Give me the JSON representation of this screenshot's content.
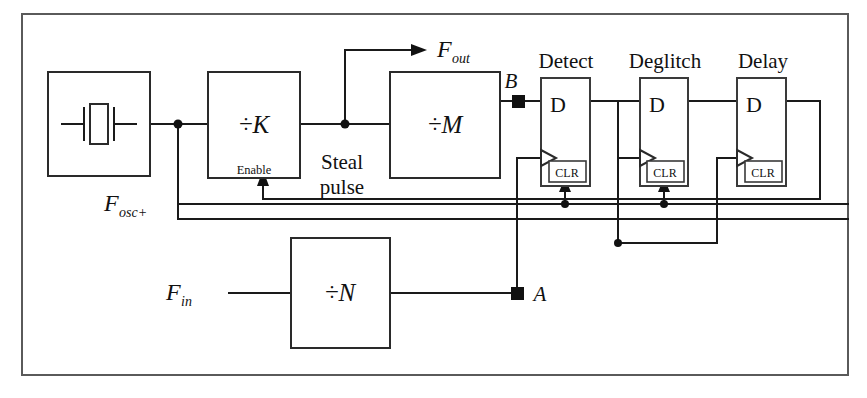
{
  "figure": {
    "type": "block-diagram",
    "frame": {
      "visible": true
    }
  },
  "blocks": {
    "oscillator": {
      "label": "",
      "icon": "crystal-icon"
    },
    "divide_k": {
      "label": "÷K",
      "sublabel": "Enable"
    },
    "divide_m": {
      "label": "÷M"
    },
    "divide_n": {
      "label": "÷N"
    },
    "ff_detect": {
      "title": "Detect",
      "d_label": "D",
      "clr_label": "CLR"
    },
    "ff_deglitch": {
      "title": "Deglitch",
      "d_label": "D",
      "clr_label": "CLR"
    },
    "ff_delay": {
      "title": "Delay",
      "d_label": "D",
      "clr_label": "CLR"
    }
  },
  "signals": {
    "f_out": "F",
    "f_out_sub": "out",
    "f_osc": "F",
    "f_osc_sub": "osc+",
    "f_in": "F",
    "f_in_sub": "in",
    "steal_pulse_line1": "Steal",
    "steal_pulse_line2": "pulse",
    "node_a": "A",
    "node_b": "B"
  },
  "colors": {
    "wire": "#1a1a1a",
    "frame": "#5a5a5a",
    "box": "#2a2a2a",
    "background": "#ffffff"
  }
}
